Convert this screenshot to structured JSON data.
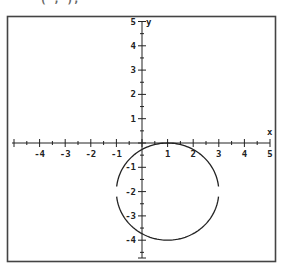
{
  "header_fragment": {
    "text_left": "( ,   ),",
    "note": "partially cropped text at top edge"
  },
  "chart_data": {
    "type": "line",
    "title": "",
    "xlabel": "x",
    "ylabel": "y",
    "xlim": [
      -5,
      5
    ],
    "ylim": [
      -5,
      5
    ],
    "grid": false,
    "x_ticks": [
      -4,
      -3,
      -2,
      -1,
      1,
      2,
      3,
      4,
      5
    ],
    "y_ticks": [
      5,
      4,
      3,
      2,
      1,
      -1,
      -2,
      -3,
      -4
    ],
    "minor_ticks_per_unit": 2,
    "series": [
      {
        "name": "circle",
        "shape": "circle",
        "center": [
          1,
          -2
        ],
        "radius": 2,
        "equation": "(x-1)^2 + (y+2)^2 = 4",
        "gaps_at": [
          [
            -1,
            -2
          ],
          [
            3,
            -2
          ]
        ]
      }
    ]
  },
  "colors": {
    "frame": "#444444",
    "axis": "#222222",
    "curve": "#222222",
    "background": "#ffffff"
  }
}
